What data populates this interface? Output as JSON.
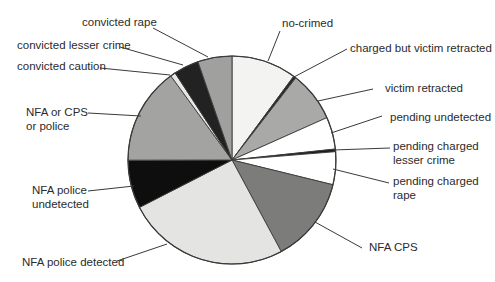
{
  "chart_data": {
    "type": "pie",
    "title": "",
    "start_angle_deg": 0,
    "direction": "clockwise",
    "unit": "percent (estimated from slice angles)",
    "slices": [
      {
        "label": "no-crimed",
        "value": 10.1,
        "color": "#f3f3f1"
      },
      {
        "label": "charged but victim retracted",
        "value": 0.4,
        "color": "#2a2a2a"
      },
      {
        "label": "victim retracted",
        "value": 7.8,
        "color": "#a9a9a7"
      },
      {
        "label": "pending undetected",
        "value": 5.0,
        "color": "#ffffff"
      },
      {
        "label": "pending charged lesser crime",
        "value": 0.4,
        "color": "#1a1a1a"
      },
      {
        "label": "pending charged rape",
        "value": 5.1,
        "color": "#ffffff"
      },
      {
        "label": "NFA CPS",
        "value": 13.3,
        "color": "#7c7c7a"
      },
      {
        "label": "NFA police detected",
        "value": 25.3,
        "color": "#e4e4e2"
      },
      {
        "label": "NFA police undetected",
        "value": 7.5,
        "color": "#0e0e0e"
      },
      {
        "label": "NFA or CPS or police",
        "value": 15.0,
        "color": "#a3a3a1"
      },
      {
        "label": "convicted caution",
        "value": 0.8,
        "color": "#e8e8e6"
      },
      {
        "label": "convicted lesser crime",
        "value": 3.9,
        "color": "#222222"
      },
      {
        "label": "convicted rape",
        "value": 5.3,
        "color": "#a0a09e"
      }
    ],
    "legend": "none (leader-line callouts)"
  },
  "labels": {
    "convicted_rape": "convicted rape",
    "convicted_lesser_crime": "convicted lesser crime",
    "convicted_caution": "convicted caution",
    "nfa_or_cps_line1": "NFA or CPS",
    "nfa_or_cps_line2": "or police",
    "nfa_police_undetected_line1": "NFA police",
    "nfa_police_undetected_line2": "undetected",
    "nfa_police_detected": "NFA police detected",
    "no_crimed": "no-crimed",
    "charged_but_victim_retracted": "charged but victim retracted",
    "victim_retracted": "victim retracted",
    "pending_undetected": "pending undetected",
    "pending_charged_lesser_line1": "pending charged",
    "pending_charged_lesser_line2": "lesser crime",
    "pending_charged_rape_line1": "pending charged",
    "pending_charged_rape_line2": "rape",
    "nfa_cps": "NFA CPS"
  }
}
